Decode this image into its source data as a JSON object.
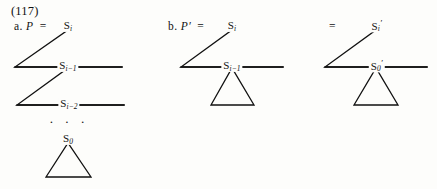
{
  "figure": {
    "equation_number": "(117)",
    "background_color": "#fdfdfb",
    "line_color": "#111111"
  },
  "panels": [
    {
      "id": "panel-a",
      "marker": "a.",
      "variable": "P",
      "equals": "=",
      "nodes": [
        {
          "name": "root",
          "symbol": "S",
          "subscript": "i",
          "prime": ""
        },
        {
          "name": "second",
          "symbol": "S",
          "subscript": "i−1",
          "prime": ""
        },
        {
          "name": "third",
          "symbol": "S",
          "subscript": "i−2",
          "prime": ""
        },
        {
          "name": "bottom",
          "symbol": "S",
          "subscript": "0",
          "prime": ""
        }
      ],
      "ellipsis": "· · ·",
      "triangle_count": 3,
      "has_ellipsis": true
    },
    {
      "id": "panel-b",
      "marker": "b.",
      "variable": "P′",
      "equals": "=",
      "nodes": [
        {
          "name": "root",
          "symbol": "S",
          "subscript": "i",
          "prime": ""
        },
        {
          "name": "second",
          "symbol": "S",
          "subscript": "i−1",
          "prime": ""
        }
      ],
      "ellipsis": "",
      "triangle_count": 2,
      "has_ellipsis": false
    },
    {
      "id": "panel-c",
      "marker": "",
      "variable": "",
      "equals": "=",
      "nodes": [
        {
          "name": "root",
          "symbol": "S",
          "subscript": "i",
          "prime": "′"
        },
        {
          "name": "second",
          "symbol": "S",
          "subscript": "0",
          "prime": "′"
        }
      ],
      "ellipsis": "",
      "triangle_count": 2,
      "has_ellipsis": false
    }
  ]
}
